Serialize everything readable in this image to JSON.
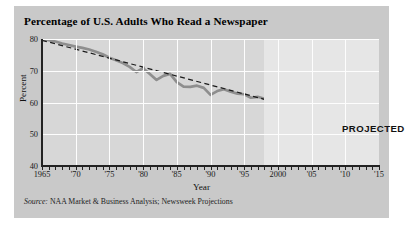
{
  "figure": {
    "title": "Percentage of U.S. Adults Who Read a Newspaper",
    "projected_label": "PROJECTED",
    "source_label": "Source:",
    "source_text": "NAA Market & Business Analysis; Newsweek Projections",
    "panel_color": "#c9c9c9",
    "plot_color": "#d7d7d7",
    "projected_band_color": "#e6e6e6",
    "gridline_color": "#fdfdfd",
    "data_line_color": "#8e8e8e",
    "trend_line_color": "#1a1a1a"
  },
  "chart_data": {
    "type": "line",
    "title": "Percentage of U.S. Adults Who Read a Newspaper",
    "xlabel": "Year",
    "ylabel": "Percent",
    "xlim": [
      1965,
      2015
    ],
    "ylim": [
      40,
      80
    ],
    "yticks": [
      40,
      50,
      60,
      70,
      80
    ],
    "ytick_labels": [
      "40",
      "50",
      "60",
      "70",
      "80"
    ],
    "xticks": [
      1965,
      1970,
      1975,
      1980,
      1985,
      1990,
      1995,
      2000,
      2005,
      2010,
      2015
    ],
    "xtick_labels": [
      "1965",
      "'70",
      "'75",
      "'80",
      "'85",
      "'90",
      "'95",
      "2000",
      "'05",
      "'10",
      "'15"
    ],
    "minor_xtick_interval": 1,
    "grid": "horizontal-and-vertical-white",
    "legend": "none",
    "annotations": [
      {
        "text": "PROJECTED",
        "x": 2007,
        "y": 65
      }
    ],
    "projection_start_year": 1998,
    "series": [
      {
        "name": "Adults who read a newspaper (actual)",
        "style": "solid",
        "color": "#8e8e8e",
        "width": 2.6,
        "x": [
          1965,
          1966,
          1967,
          1968,
          1969,
          1970,
          1971,
          1972,
          1973,
          1974,
          1975,
          1976,
          1977,
          1978,
          1979,
          1980,
          1981,
          1982,
          1983,
          1984,
          1985,
          1986,
          1987,
          1988,
          1989,
          1990,
          1991,
          1992,
          1993,
          1994,
          1995,
          1996,
          1997,
          1998
        ],
        "values": [
          80.0,
          79.6,
          79.2,
          78.6,
          78.1,
          77.6,
          77.2,
          76.7,
          76.0,
          75.2,
          74.1,
          73.3,
          72.4,
          71.2,
          69.6,
          70.8,
          69.0,
          67.1,
          68.4,
          69.0,
          66.4,
          65.0,
          64.9,
          65.3,
          64.6,
          62.4,
          63.6,
          64.2,
          63.4,
          62.8,
          62.6,
          61.5,
          61.8,
          61.2
        ]
      },
      {
        "name": "Adults who read a newspaper (projected)",
        "style": "solid",
        "color": "#8e8e8e",
        "width": 2.6,
        "x": [
          1998,
          2015
        ],
        "values": [
          61.2,
          47.5
        ]
      },
      {
        "name": "Linear trend",
        "style": "dashed",
        "color": "#1a1a1a",
        "width": 1.2,
        "x": [
          1965,
          1998
        ],
        "values": [
          79.6,
          61.0
        ]
      }
    ]
  }
}
